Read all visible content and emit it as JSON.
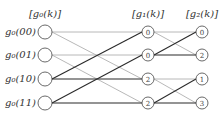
{
  "headers": {
    "col0": "[g₀(k)]",
    "col1": "[g₁(k)]",
    "col2": "[g₂(k)]"
  },
  "inputs": [
    {
      "label": "g₀(00)"
    },
    {
      "label": "g₀(01)"
    },
    {
      "label": "g₀(10)"
    },
    {
      "label": "g₀(11)"
    }
  ],
  "stage1_nodes": [
    "0",
    "0",
    "2",
    "2"
  ],
  "stage2_nodes": [
    "0",
    "2",
    "1",
    "3"
  ],
  "colors": {
    "light_edge": "#b0b0b0",
    "dark_edge": "#2a2a2a",
    "node_stroke": "#444444"
  },
  "edges": {
    "stage0_to_1": [
      {
        "from": 0,
        "to": 0,
        "weight": "light"
      },
      {
        "from": 0,
        "to": 2,
        "weight": "light"
      },
      {
        "from": 1,
        "to": 1,
        "weight": "light"
      },
      {
        "from": 1,
        "to": 3,
        "weight": "light"
      },
      {
        "from": 2,
        "to": 0,
        "weight": "dark"
      },
      {
        "from": 2,
        "to": 2,
        "weight": "dark"
      },
      {
        "from": 3,
        "to": 1,
        "weight": "dark"
      },
      {
        "from": 3,
        "to": 3,
        "weight": "dark"
      }
    ],
    "stage1_to_2": [
      {
        "from": 0,
        "to": 0,
        "weight": "light"
      },
      {
        "from": 0,
        "to": 1,
        "weight": "light"
      },
      {
        "from": 1,
        "to": 0,
        "weight": "dark"
      },
      {
        "from": 1,
        "to": 1,
        "weight": "dark"
      },
      {
        "from": 2,
        "to": 2,
        "weight": "light"
      },
      {
        "from": 2,
        "to": 3,
        "weight": "light"
      },
      {
        "from": 3,
        "to": 2,
        "weight": "dark"
      },
      {
        "from": 3,
        "to": 3,
        "weight": "dark"
      }
    ]
  }
}
